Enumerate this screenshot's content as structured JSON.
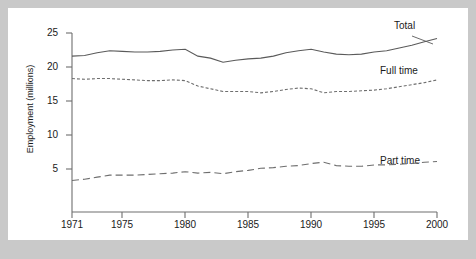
{
  "chart_data": {
    "type": "line",
    "title": "",
    "xlabel": "",
    "ylabel": "Employment (millions)",
    "xlim": [
      1971,
      2000
    ],
    "ylim": [
      0,
      25
    ],
    "yticks": [
      5,
      10,
      15,
      20,
      25
    ],
    "xticks": [
      1971,
      1975,
      1980,
      1985,
      1990,
      1995,
      2000
    ],
    "grid": false,
    "legend_position": "inline-right",
    "x": [
      1971,
      1972,
      1973,
      1974,
      1975,
      1976,
      1977,
      1978,
      1979,
      1980,
      1981,
      1982,
      1983,
      1984,
      1985,
      1986,
      1987,
      1988,
      1989,
      1990,
      1991,
      1992,
      1993,
      1994,
      1995,
      1996,
      1997,
      1998,
      1999,
      2000
    ],
    "series": [
      {
        "name": "Total",
        "style": "solid",
        "values": [
          21.6,
          21.7,
          22.1,
          22.4,
          22.3,
          22.2,
          22.2,
          22.3,
          22.5,
          22.6,
          21.6,
          21.3,
          20.7,
          21.0,
          21.2,
          21.3,
          21.6,
          22.1,
          22.4,
          22.6,
          22.2,
          21.9,
          21.8,
          21.9,
          22.2,
          22.4,
          22.8,
          23.2,
          23.7,
          24.2
        ]
      },
      {
        "name": "Full time",
        "style": "dotted",
        "values": [
          18.3,
          18.2,
          18.3,
          18.3,
          18.2,
          18.1,
          18.0,
          18.0,
          18.1,
          18.0,
          17.2,
          16.8,
          16.4,
          16.4,
          16.4,
          16.2,
          16.4,
          16.7,
          16.9,
          16.8,
          16.2,
          16.4,
          16.4,
          16.5,
          16.6,
          16.8,
          17.1,
          17.4,
          17.7,
          18.1
        ]
      },
      {
        "name": "Part time",
        "style": "dashed",
        "values": [
          3.3,
          3.5,
          3.8,
          4.1,
          4.1,
          4.1,
          4.2,
          4.3,
          4.4,
          4.6,
          4.4,
          4.5,
          4.3,
          4.6,
          4.8,
          5.1,
          5.2,
          5.4,
          5.5,
          5.8,
          6.0,
          5.5,
          5.4,
          5.4,
          5.6,
          5.6,
          5.7,
          5.8,
          6.0,
          6.1
        ]
      }
    ],
    "colors": {
      "total": "#5a5a5a",
      "full_time": "#6e6e6e",
      "part_time": "#6e6e6e",
      "axis": "#6e6e6e",
      "text": "#1a1a1a",
      "plot_background": "#ffffff",
      "page_background": "#c9c9c9"
    },
    "annotations": [
      {
        "text": "Total",
        "series": "Total"
      },
      {
        "text": "Full time",
        "series": "Full time"
      },
      {
        "text": "Part time",
        "series": "Part time"
      }
    ]
  }
}
